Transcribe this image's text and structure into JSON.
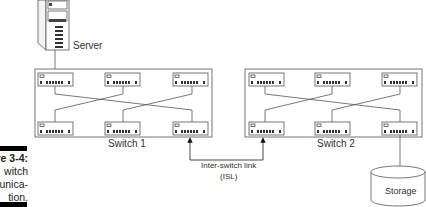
{
  "figure": {
    "caption_lines": [
      "re 3-4:",
      "witch",
      "unica-",
      "tion."
    ],
    "server_label": "Server",
    "switches": [
      {
        "label": "Switch 1",
        "modules": 6
      },
      {
        "label": "Switch 2",
        "modules": 6
      }
    ],
    "isl_label_line1": "Inter-switch link",
    "isl_label_line2": "(ISL)",
    "storage_label": "Storage"
  },
  "colors": {
    "line": "#555555",
    "box": "#666666",
    "bar": "#000000"
  }
}
